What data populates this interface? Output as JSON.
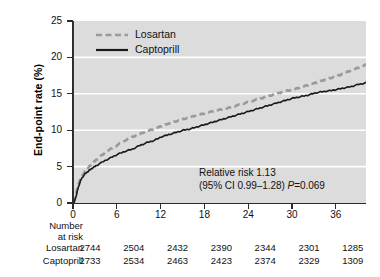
{
  "chart_data": {
    "type": "line",
    "title": "",
    "xlabel": "",
    "ylabel": "End-point rate (%)",
    "xlim": [
      0,
      40
    ],
    "ylim": [
      0,
      25
    ],
    "xticks": [
      0,
      6,
      12,
      18,
      24,
      30,
      36
    ],
    "yticks": [
      0,
      5,
      10,
      15,
      20,
      25
    ],
    "xtick_labels": [
      "0",
      "6",
      "12",
      "18",
      "24",
      "30",
      "36"
    ],
    "ytick_labels": [
      "0",
      "5",
      "10",
      "15",
      "20",
      "25"
    ],
    "grid": "horizontal-white",
    "legend_position": "top-left",
    "series": [
      {
        "name": "Losartan",
        "style": "dashed",
        "color": "#9a9a9a",
        "x": [
          0,
          0.3,
          0.6,
          1,
          1.5,
          2,
          2.5,
          3,
          4,
          5,
          6,
          7,
          8,
          9,
          10,
          11,
          12,
          13,
          14,
          15,
          16,
          17,
          18,
          19,
          20,
          21,
          22,
          23,
          24,
          25,
          26,
          27,
          28,
          29,
          30,
          31,
          32,
          33,
          34,
          35,
          36,
          37,
          38,
          39,
          40
        ],
        "y": [
          0,
          1.4,
          2.6,
          3.6,
          4.3,
          4.9,
          5.4,
          5.9,
          6.7,
          7.4,
          8.0,
          8.6,
          9.1,
          9.5,
          9.9,
          10.2,
          10.6,
          10.9,
          11.2,
          11.5,
          11.8,
          12.1,
          12.3,
          12.6,
          12.8,
          13.0,
          13.3,
          13.6,
          13.9,
          14.2,
          14.5,
          14.8,
          15.1,
          15.4,
          15.6,
          15.9,
          16.2,
          16.5,
          16.8,
          17.1,
          17.4,
          17.8,
          18.2,
          18.6,
          19.0
        ]
      },
      {
        "name": "Captoprill",
        "style": "solid",
        "color": "#1a1a1a",
        "x": [
          0,
          0.3,
          0.6,
          1,
          1.5,
          2,
          2.5,
          3,
          4,
          5,
          6,
          7,
          8,
          9,
          10,
          11,
          12,
          13,
          14,
          15,
          16,
          17,
          18,
          19,
          20,
          21,
          22,
          23,
          24,
          25,
          26,
          27,
          28,
          29,
          30,
          31,
          32,
          33,
          34,
          35,
          36,
          37,
          38,
          39,
          40
        ],
        "y": [
          0,
          1.0,
          2.2,
          3.3,
          4.0,
          4.4,
          4.8,
          5.1,
          5.7,
          6.2,
          6.7,
          7.1,
          7.4,
          7.9,
          8.3,
          8.6,
          9.1,
          9.4,
          9.7,
          10.0,
          10.2,
          10.5,
          10.8,
          11.1,
          11.4,
          11.7,
          12.0,
          12.3,
          12.6,
          12.9,
          13.2,
          13.5,
          13.8,
          14.1,
          14.4,
          14.6,
          14.8,
          15.1,
          15.3,
          15.4,
          15.6,
          15.8,
          16.0,
          16.3,
          16.5
        ]
      }
    ],
    "annotation": {
      "line1": "Relative risk 1.13",
      "line2_prefix": "(95% CI 0.99–1.28) ",
      "line2_p_symbol": "P",
      "line2_p_value": "=0.069"
    }
  },
  "legend": {
    "items": [
      {
        "label": "Losartan",
        "icon": "dashed-line-swatch"
      },
      {
        "label": "Captoprill",
        "icon": "solid-line-swatch"
      }
    ]
  },
  "risk_table": {
    "title_line1": "Number",
    "title_line2": "at risk",
    "rows": [
      {
        "label": "Losartan",
        "values": [
          "2744",
          "2504",
          "2432",
          "2390",
          "2344",
          "2301",
          "1285"
        ]
      },
      {
        "label": "Captoprill",
        "values": [
          "2733",
          "2534",
          "2463",
          "2423",
          "2374",
          "2329",
          "1309"
        ]
      }
    ]
  },
  "colors": {
    "plot_background": "#dcdcdc",
    "gridline": "#ffffff",
    "axis": "#2b2b2b",
    "losartan": "#9a9a9a",
    "captoprill": "#1a1a1a",
    "text": "#111111"
  }
}
